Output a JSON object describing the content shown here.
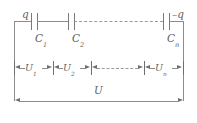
{
  "figure": {
    "type": "circuit-diagram",
    "line_color": "#8c8c8c",
    "label_color": "#5f5f5f",
    "background": "#ffffff"
  },
  "charges": {
    "left_label": "q",
    "right_label": "–q"
  },
  "capacitors": [
    {
      "label": "C",
      "subscript": "1"
    },
    {
      "label": "C",
      "subscript": "2"
    },
    {
      "label": "C",
      "subscript": "n"
    }
  ],
  "voltages": [
    {
      "label": "U",
      "subscript": "1"
    },
    {
      "label": "U",
      "subscript": "2"
    },
    {
      "label": "U",
      "subscript": "n"
    }
  ],
  "total_voltage": {
    "label": "U",
    "subscript": ""
  },
  "ellipsis": {
    "style": "dashed-line",
    "meaning": "continuation of series capacitors"
  }
}
